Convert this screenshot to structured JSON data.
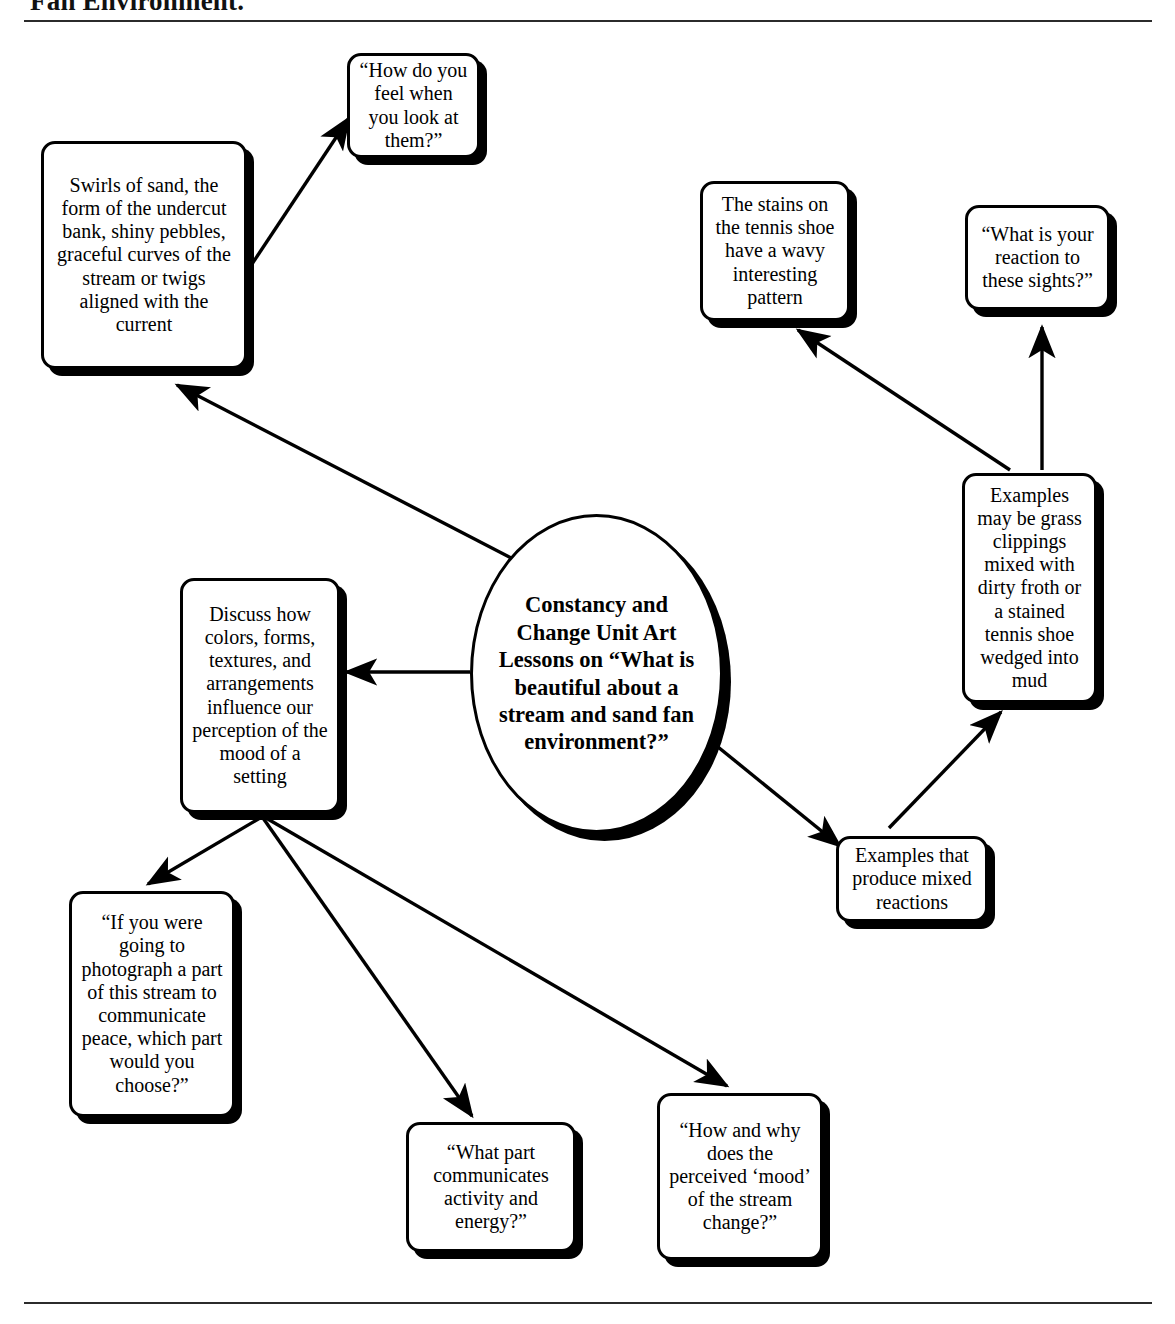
{
  "header": {
    "title": "Fan Environment.",
    "divider_top": "horizontal-rule",
    "divider_bottom": "horizontal-rule"
  },
  "diagram": {
    "type": "concept-map",
    "center": {
      "id": "center",
      "shape": "ellipse",
      "text": "Constancy and Change Unit Art Lessons on “What is beautiful about a stream and sand fan environment?”"
    },
    "nodes": [
      {
        "id": "swirls",
        "shape": "rounded-rect",
        "text": "Swirls of sand, the form of the undercut bank, shiny pebbles, graceful curves of the stream or twigs aligned with the current"
      },
      {
        "id": "feel",
        "shape": "rounded-rect",
        "text": "“How do you feel when you look at them?”"
      },
      {
        "id": "stains",
        "shape": "rounded-rect",
        "text": "The stains on the tennis shoe have a wavy interesting pattern"
      },
      {
        "id": "reaction",
        "shape": "rounded-rect",
        "text": "“What is your reaction to these sights?”"
      },
      {
        "id": "grass",
        "shape": "rounded-rect",
        "text": "Examples may be grass clippings mixed with dirty froth or a stained tennis shoe wedged into mud"
      },
      {
        "id": "mixed",
        "shape": "rounded-rect",
        "text": "Examples that produce mixed reactions"
      },
      {
        "id": "discuss",
        "shape": "rounded-rect",
        "text": "Discuss how colors, forms, textures, and arrangements influence our perception of the mood of a setting"
      },
      {
        "id": "photograph",
        "shape": "rounded-rect",
        "text": "“If you were going to photograph a part of this stream to communicate peace, which part would you choose?”"
      },
      {
        "id": "activity",
        "shape": "rounded-rect",
        "text": "“What part communicates activity and energy?”"
      },
      {
        "id": "mood",
        "shape": "rounded-rect",
        "text": "“How and why does the perceived ‘mood’ of the stream change?”"
      }
    ],
    "edges": [
      {
        "from": "center",
        "to": "swirls",
        "style": "arrow"
      },
      {
        "from": "swirls",
        "to": "feel",
        "style": "arrow"
      },
      {
        "from": "center",
        "to": "discuss",
        "style": "arrow"
      },
      {
        "from": "discuss",
        "to": "photograph",
        "style": "arrow"
      },
      {
        "from": "discuss",
        "to": "activity",
        "style": "arrow"
      },
      {
        "from": "discuss",
        "to": "mood",
        "style": "arrow"
      },
      {
        "from": "center",
        "to": "mixed",
        "style": "arrow"
      },
      {
        "from": "mixed",
        "to": "grass",
        "style": "arrow"
      },
      {
        "from": "grass",
        "to": "stains",
        "style": "arrow"
      },
      {
        "from": "grass",
        "to": "reaction",
        "style": "arrow"
      }
    ]
  },
  "colors": {
    "ink": "#000000",
    "paper": "#ffffff",
    "rule": "#2b2b2b"
  }
}
